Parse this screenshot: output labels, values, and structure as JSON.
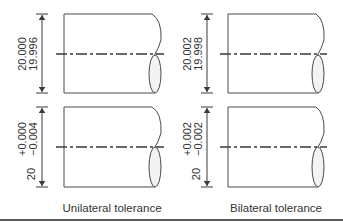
{
  "figure": {
    "left_panel": {
      "caption": "Unilateral tolerance",
      "top": {
        "upper_limit": "20.000",
        "lower_limit": "19.996"
      },
      "bottom": {
        "basic": "20",
        "upper_dev": "+0.000",
        "lower_dev": "−0.004"
      }
    },
    "right_panel": {
      "caption": "Bilateral tolerance",
      "top": {
        "upper_limit": "20.002",
        "lower_limit": "19.998"
      },
      "bottom": {
        "basic": "20",
        "upper_dev": "+0.002",
        "lower_dev": "−0.002"
      }
    },
    "colors": {
      "line": "#4a4a4a",
      "ellipse_fill": "#f3f3f3",
      "text": "#333333"
    }
  }
}
